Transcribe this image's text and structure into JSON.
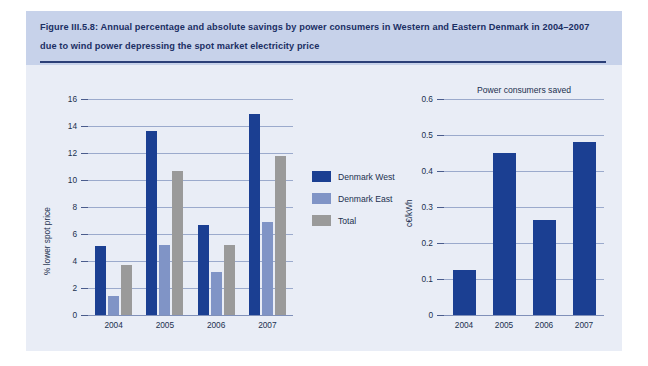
{
  "figure": {
    "title": "Figure III.5.8: Annual percentage and absolute savings by power consumers in Western and Eastern Denmark in 2004–2007 due to wind power depressing the spot market electricity price",
    "source": "Source: Risø DTU",
    "accent_color": "#1b3f92",
    "header_band_color": "#c7d2ea",
    "panel_color": "#e9edf6"
  },
  "legend": {
    "items": [
      {
        "label": "Denmark West",
        "color": "#1b3f92",
        "key": "west"
      },
      {
        "label": "Denmark East",
        "color": "#8094c6",
        "key": "east"
      },
      {
        "label": "Total",
        "color": "#9a9a9a",
        "key": "total"
      }
    ]
  },
  "chart_data": [
    {
      "id": "percent-savings",
      "type": "bar",
      "title": "",
      "xlabel": "",
      "ylabel": "% lower spot price",
      "categories": [
        "2004",
        "2005",
        "2006",
        "2007"
      ],
      "ylim": [
        0,
        16
      ],
      "yticks": [
        0,
        2,
        4,
        6,
        8,
        10,
        12,
        14,
        16
      ],
      "ytick_labels": [
        "0",
        "2",
        "4",
        "6",
        "8",
        "10",
        "12",
        "14",
        "16"
      ],
      "grid": true,
      "legend_position": "right",
      "series": [
        {
          "name": "Denmark West",
          "color": "#1b3f92",
          "values": [
            5.1,
            13.6,
            6.7,
            14.9
          ]
        },
        {
          "name": "Denmark East",
          "color": "#8094c6",
          "values": [
            1.4,
            5.2,
            3.2,
            6.9
          ]
        },
        {
          "name": "Total",
          "color": "#9a9a9a",
          "values": [
            3.7,
            10.7,
            5.2,
            11.8
          ]
        }
      ]
    },
    {
      "id": "power-consumers-saved",
      "type": "bar",
      "title": "Power consumers saved",
      "xlabel": "",
      "ylabel": "c€/kWh",
      "categories": [
        "2004",
        "2005",
        "2006",
        "2007"
      ],
      "ylim": [
        0,
        0.6
      ],
      "yticks": [
        0,
        0.1,
        0.2,
        0.3,
        0.4,
        0.5,
        0.6
      ],
      "ytick_labels": [
        "0",
        "0.1",
        "0.2",
        "0.3",
        "0.4",
        "0.5",
        "0.6"
      ],
      "grid": true,
      "legend_position": "none",
      "series": [
        {
          "name": "Power consumers saved",
          "color": "#1b3f92",
          "values": [
            0.125,
            0.45,
            0.265,
            0.48
          ]
        }
      ]
    }
  ]
}
